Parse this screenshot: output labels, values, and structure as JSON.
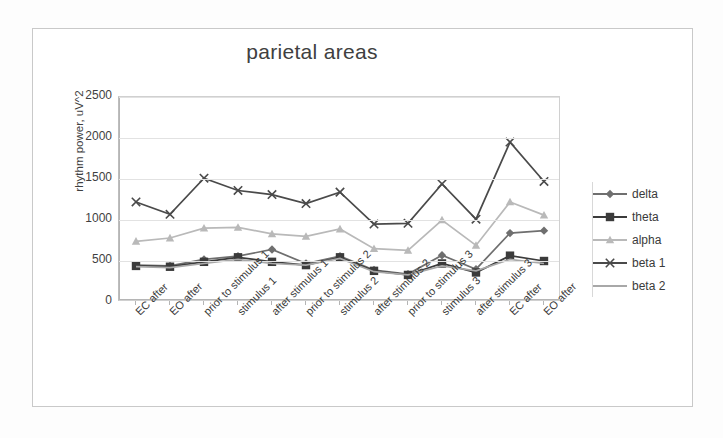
{
  "chart_data": {
    "type": "line",
    "title": "parietal areas",
    "xlabel": "",
    "ylabel": "rhythm power, uV^2",
    "ylim": [
      0,
      2500
    ],
    "ytick_step": 500,
    "yticks": [
      "2500",
      "2000",
      "1500",
      "1000",
      "500",
      "0"
    ],
    "grid": true,
    "legend_position": "right",
    "categories": [
      "EC after",
      "EO after",
      "prior to stimulus 1",
      "stimulus 1",
      "after stimulus 1",
      "prior to stimulus 2",
      "stimulus 2",
      "after stimulus 2",
      "prior to stimulus 3",
      "stimulus 3",
      "after stimulus 3",
      "EC after",
      "EO after"
    ],
    "series": [
      {
        "name": "delta",
        "color": "#6f6f6f",
        "marker": "diamond",
        "values": [
          450,
          440,
          520,
          560,
          640,
          470,
          560,
          390,
          340,
          570,
          400,
          840,
          870
        ]
      },
      {
        "name": "theta",
        "color": "#3b3b3b",
        "marker": "square",
        "values": [
          440,
          430,
          490,
          545,
          490,
          450,
          545,
          380,
          330,
          470,
          360,
          565,
          500
        ]
      },
      {
        "name": "alpha",
        "color": "#b9b9b9",
        "marker": "triangle",
        "values": [
          740,
          780,
          900,
          910,
          830,
          800,
          890,
          650,
          630,
          1000,
          690,
          1220,
          1060
        ]
      },
      {
        "name": "beta 1",
        "color": "#4a4a4a",
        "marker": "cross",
        "values": [
          1220,
          1070,
          1510,
          1360,
          1310,
          1200,
          1340,
          950,
          960,
          1440,
          1010,
          1950,
          1470
        ]
      },
      {
        "name": "beta 2",
        "color": "#a8a8a8",
        "marker": "none",
        "values": [
          430,
          420,
          470,
          520,
          470,
          450,
          530,
          370,
          330,
          440,
          380,
          520,
          470
        ]
      }
    ]
  }
}
